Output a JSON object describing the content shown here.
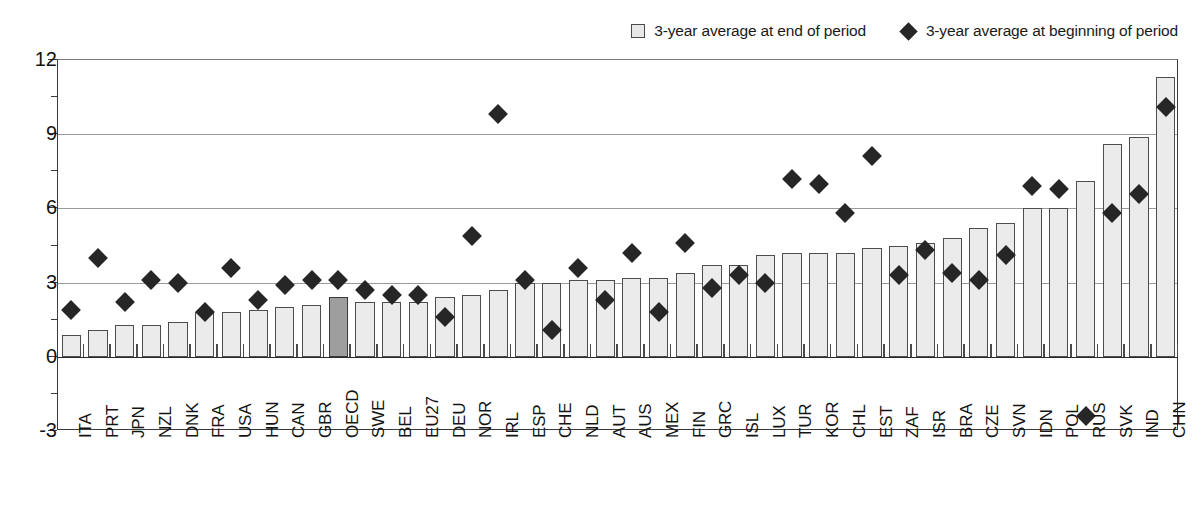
{
  "legend": {
    "entries": [
      {
        "icon": "square-swatch-icon",
        "label": "3-year average at end of period"
      },
      {
        "icon": "diamond-marker-icon",
        "label": "3-year average at beginning of period"
      }
    ]
  },
  "axes": {
    "y_ticks": [
      "12",
      "9",
      "6",
      "3",
      "0",
      "-3"
    ],
    "y_min": -3,
    "y_max": 12
  },
  "highlight": {
    "category": "OECD",
    "color": "#9e9e9e"
  },
  "colors": {
    "bar_fill": "#ebebeb",
    "bar_stroke": "#4d4d4d",
    "highlight_fill": "#9e9e9e",
    "marker": "#262626",
    "gridline": "#9a9a9a",
    "axis": "#3a3a3a"
  },
  "chart_data": {
    "type": "bar",
    "title": "",
    "subtitle": "",
    "xlabel": "",
    "ylabel": "",
    "ylim": [
      -3,
      12
    ],
    "yticks": [
      -3,
      0,
      3,
      6,
      9,
      12
    ],
    "grid": true,
    "legend_position": "top-right",
    "categories": [
      "ITA",
      "PRT",
      "JPN",
      "NZL",
      "DNK",
      "FRA",
      "USA",
      "HUN",
      "CAN",
      "GBR",
      "OECD",
      "SWE",
      "BEL",
      "EU27",
      "DEU",
      "NOR",
      "IRL",
      "ESP",
      "CHE",
      "NLD",
      "AUT",
      "AUS",
      "MEX",
      "FIN",
      "GRC",
      "ISL",
      "LUX",
      "TUR",
      "KOR",
      "CHL",
      "EST",
      "ZAF",
      "ISR",
      "BRA",
      "CZE",
      "SVN",
      "IDN",
      "POL",
      "RUS",
      "SVK",
      "IND",
      "CHN"
    ],
    "series": [
      {
        "name": "3-year average at end of period",
        "type": "bar",
        "values": [
          0.9,
          1.1,
          1.3,
          1.3,
          1.4,
          1.8,
          1.8,
          1.9,
          2.0,
          2.1,
          2.4,
          2.2,
          2.2,
          2.2,
          2.4,
          2.5,
          2.7,
          3.0,
          3.0,
          3.1,
          3.1,
          3.2,
          3.2,
          3.4,
          3.7,
          3.7,
          4.1,
          4.2,
          4.2,
          4.2,
          4.4,
          4.5,
          4.6,
          4.8,
          5.2,
          5.4,
          6.0,
          6.0,
          7.1,
          8.6,
          8.9,
          11.3
        ]
      },
      {
        "name": "3-year average at beginning of period",
        "type": "scatter",
        "values": [
          1.9,
          4.0,
          2.2,
          3.1,
          3.0,
          1.8,
          3.6,
          2.3,
          2.9,
          3.1,
          3.1,
          2.7,
          2.5,
          2.5,
          1.6,
          4.9,
          9.8,
          3.1,
          1.1,
          3.6,
          2.3,
          4.2,
          1.8,
          4.6,
          2.8,
          3.3,
          3.0,
          7.2,
          7.0,
          5.8,
          8.1,
          3.3,
          4.3,
          3.4,
          3.1,
          4.1,
          6.9,
          6.8,
          -2.4,
          5.8,
          6.6,
          10.1
        ]
      }
    ]
  }
}
